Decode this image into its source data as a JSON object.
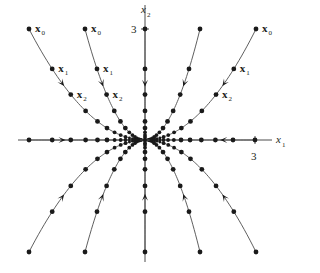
{
  "figure": {
    "origin_px": [
      145,
      140
    ],
    "line_color": "#4d4d4d",
    "dot_color": "#1a1a1a",
    "axes": {
      "x1": {
        "label": "x",
        "subscript": "1",
        "tick_label": "3",
        "tick_px": 255,
        "extent_px": [
          18,
          272
        ]
      },
      "x2": {
        "label": "x",
        "subscript": "2",
        "tick_label": "3",
        "tick_px": 29,
        "extent_px": [
          5,
          262
        ]
      }
    },
    "eigenvalues": {
      "x1_ratio": 0.8,
      "x2_ratio": 0.64
    },
    "trajectory_labels": {
      "x0": {
        "base": "x",
        "sub": "0"
      },
      "x1": {
        "base": "x",
        "sub": "1"
      },
      "x2": {
        "base": "x",
        "sub": "2"
      }
    },
    "trajectories": [
      {
        "name": "upper-left-outer",
        "start_offset_px": [
          -116,
          -111
        ],
        "labeled": true,
        "label_side": "right"
      },
      {
        "name": "upper-left-inner",
        "start_offset_px": [
          -60,
          -111
        ],
        "labeled": true,
        "label_side": "right"
      },
      {
        "name": "upper-right-inner",
        "start_offset_px": [
          55,
          -111
        ],
        "labeled": false
      },
      {
        "name": "upper-right-outer",
        "start_offset_px": [
          111,
          -111
        ],
        "labeled": true,
        "label_side": "right"
      },
      {
        "name": "lower-left-outer",
        "start_offset_px": [
          -116,
          112
        ],
        "labeled": false
      },
      {
        "name": "lower-left-inner",
        "start_offset_px": [
          -60,
          112
        ],
        "labeled": false
      },
      {
        "name": "lower-right-inner",
        "start_offset_px": [
          55,
          112
        ],
        "labeled": false
      },
      {
        "name": "lower-right-outer",
        "start_offset_px": [
          111,
          112
        ],
        "labeled": false
      },
      {
        "name": "axis-positive-x1",
        "start_offset_px": [
          110,
          0
        ],
        "labeled": false
      },
      {
        "name": "axis-negative-x1",
        "start_offset_px": [
          -116,
          0
        ],
        "labeled": false
      },
      {
        "name": "axis-positive-x2",
        "start_offset_px": [
          0,
          -111
        ],
        "labeled": false
      },
      {
        "name": "axis-negative-x2",
        "start_offset_px": [
          0,
          112
        ],
        "labeled": false
      }
    ],
    "steps": 14
  }
}
